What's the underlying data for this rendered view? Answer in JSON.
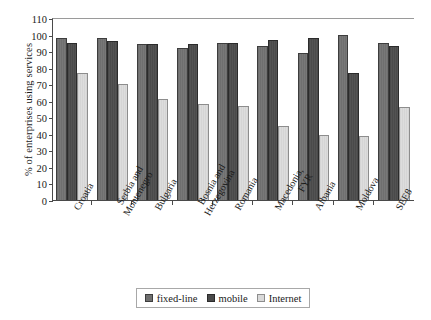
{
  "chart_data": {
    "type": "bar",
    "title": "",
    "xlabel": "",
    "ylabel": "% of enterprises using services",
    "ylim": [
      0,
      110
    ],
    "ytick_step": 10,
    "yticks": [
      0,
      10,
      20,
      30,
      40,
      50,
      60,
      70,
      80,
      90,
      100,
      110
    ],
    "grid": false,
    "legend_position": "bottom-center",
    "categories": [
      "Croatia",
      "Serbia and Montenegro",
      "Bulgaria",
      "Bosnia and Herzegovina",
      "Romania",
      "Macedonia, FYR",
      "Albania",
      "Moldova",
      "SEE8"
    ],
    "category_lines": [
      [
        "Croatia"
      ],
      [
        "Serbia and",
        "Montenegro"
      ],
      [
        "Bulgaria"
      ],
      [
        "Bosnia and",
        "Herzegovina"
      ],
      [
        "Romania"
      ],
      [
        "Macedonia,",
        "FYR"
      ],
      [
        "Albania"
      ],
      [
        "Moldova"
      ],
      [
        "SEE8"
      ]
    ],
    "series": [
      {
        "name": "fixed-line",
        "color": "#6f6f6f",
        "values": [
          98,
          98,
          94,
          92,
          95,
          93,
          89,
          100,
          95
        ]
      },
      {
        "name": "mobile",
        "color": "#4a4a4a",
        "values": [
          95,
          96,
          94,
          94,
          95,
          96.5,
          98,
          76.5,
          93
        ]
      },
      {
        "name": "Internet",
        "color": "#d9d9d9",
        "values": [
          76.5,
          70,
          61,
          58,
          57,
          45,
          39,
          38.5,
          56
        ]
      }
    ]
  },
  "legend": {
    "items": [
      {
        "label": "fixed-line"
      },
      {
        "label": "mobile"
      },
      {
        "label": "Internet"
      }
    ]
  }
}
